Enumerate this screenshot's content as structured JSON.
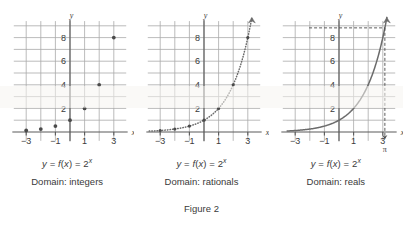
{
  "figure": {
    "label": "Figure 2",
    "panel_width": 134.33,
    "colors": {
      "grid": "#a9a9a9",
      "axis": "#5a5a5a",
      "curve": "#6b6b6b",
      "point": "#4a4a4a",
      "text": "#3a3a3a",
      "background": "#ffffff"
    }
  },
  "panels": [
    {
      "id": "panel-integers",
      "equation_parts": {
        "y": "y",
        "eq1": " = ",
        "f": "f",
        "lparen": "(",
        "x": "x",
        "rparen": ")",
        "eq2": " = ",
        "base": "2",
        "exponent": "x"
      },
      "equation_text": "y = f(x) = 2^x",
      "domain_label": "Domain:  integers",
      "axis_label_x": "x",
      "axis_label_y": "y",
      "x_ticks": [
        "-3",
        "-1",
        "1",
        "3"
      ],
      "y_ticks": [
        "2",
        "4",
        "6",
        "8"
      ],
      "render": "points",
      "points": [
        {
          "x": -3,
          "y": 0.125
        },
        {
          "x": -2,
          "y": 0.25
        },
        {
          "x": -1,
          "y": 0.5
        },
        {
          "x": 0,
          "y": 1
        },
        {
          "x": 1,
          "y": 2
        },
        {
          "x": 2,
          "y": 4
        },
        {
          "x": 3,
          "y": 8
        }
      ],
      "has_arrow": false,
      "has_pi_marker": false
    },
    {
      "id": "panel-rationals",
      "equation_parts": {
        "y": "y",
        "eq1": " = ",
        "f": "f",
        "lparen": "(",
        "x": "x",
        "rparen": ")",
        "eq2": " = ",
        "base": "2",
        "exponent": "x"
      },
      "equation_text": "y = f(x) = 2^x",
      "domain_label": "Domain:  rationals",
      "axis_label_x": "x",
      "axis_label_y": "y",
      "x_ticks": [
        "-3",
        "-1",
        "1",
        "3"
      ],
      "y_ticks": [
        "2",
        "4",
        "6",
        "8"
      ],
      "render": "dotted-curve",
      "points": [
        {
          "x": -3,
          "y": 0.125
        },
        {
          "x": -2,
          "y": 0.25
        },
        {
          "x": -1,
          "y": 0.5
        },
        {
          "x": 0,
          "y": 1
        },
        {
          "x": 1,
          "y": 2
        },
        {
          "x": 2,
          "y": 4
        },
        {
          "x": 3,
          "y": 8
        }
      ],
      "has_arrow": true,
      "has_pi_marker": false
    },
    {
      "id": "panel-reals",
      "equation_parts": {
        "y": "y",
        "eq1": " = ",
        "f": "f",
        "lparen": "(",
        "x": "x",
        "rparen": ")",
        "eq2": " = ",
        "base": "2",
        "exponent": "x"
      },
      "equation_text": "y = f(x) = 2^x",
      "domain_label": "Domain:  reals",
      "axis_label_x": "x",
      "axis_label_y": "y",
      "x_ticks": [
        "-3",
        "-1",
        "1",
        "3"
      ],
      "y_ticks": [
        "2",
        "4",
        "6",
        "8"
      ],
      "render": "solid-curve",
      "points": [],
      "has_arrow": true,
      "has_pi_marker": true,
      "pi_symbol": "π",
      "pi_value_x": 3.14159,
      "pi_value_y": 8.825
    }
  ],
  "chart_data": {
    "type": "line",
    "title": "Figure 2",
    "xlabel": "x",
    "ylabel": "y",
    "xlim": [
      -3.9,
      3.9
    ],
    "ylim": [
      -0.9,
      9.6
    ],
    "xticks": [
      -3,
      -1,
      1,
      3
    ],
    "yticks": [
      2,
      4,
      6,
      8
    ],
    "grid": true,
    "legend": null,
    "series": [
      {
        "name": "y = f(x) = 2^x, Domain: integers",
        "style": "points",
        "x": [
          -3,
          -2,
          -1,
          0,
          1,
          2,
          3
        ],
        "values": [
          0.125,
          0.25,
          0.5,
          1,
          2,
          4,
          8
        ]
      },
      {
        "name": "y = f(x) = 2^x, Domain: rationals",
        "style": "dotted",
        "x": [
          -3,
          -2,
          -1,
          0,
          1,
          2,
          3
        ],
        "values": [
          0.125,
          0.25,
          0.5,
          1,
          2,
          4,
          8
        ]
      },
      {
        "name": "y = f(x) = 2^x, Domain: reals",
        "style": "solid",
        "x": [
          -3,
          -2,
          -1,
          0,
          1,
          2,
          3,
          3.14159
        ],
        "values": [
          0.125,
          0.25,
          0.5,
          1,
          2,
          4,
          8,
          8.825
        ]
      }
    ],
    "annotations": [
      {
        "text": "π",
        "x": 3.14159,
        "y": 0,
        "panel": "panel-reals"
      }
    ]
  }
}
